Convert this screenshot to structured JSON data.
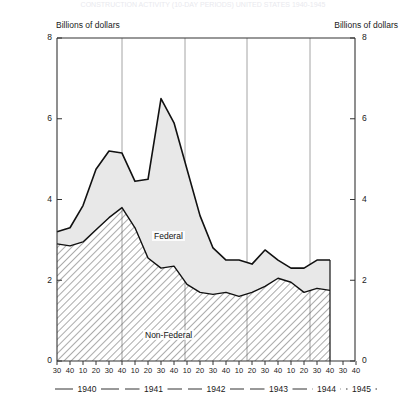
{
  "title_cut": "CONSTRUCTION ACTIVITY (10-DAY PERIODS) UNITED STATES 1940-1945",
  "axis_caption_left": "Billions of dollars",
  "axis_caption_right": "Billions of dollars",
  "series_labels": {
    "federal": "Federal",
    "non_federal": "Non-Federal"
  },
  "colors": {
    "federal_fill": "#e8e8e8",
    "non_federal_fill": "#ffffff",
    "line": "#111111",
    "grid": "#9a9a9a",
    "axis": "#333333",
    "hatch": "#444444"
  },
  "chart_data": {
    "type": "area",
    "title": "",
    "xlabel": "",
    "ylabel": "Billions of dollars",
    "ylim": [
      0,
      8
    ],
    "yticks": [
      0,
      2,
      4,
      6,
      8
    ],
    "grid": true,
    "legend_position": "inline",
    "stacked": true,
    "x_tick_labels": [
      "30",
      "40",
      "10",
      "20",
      "30",
      "40",
      "10",
      "20",
      "30",
      "40",
      "10",
      "20",
      "30",
      "40",
      "10",
      "20",
      "30",
      "40",
      "10",
      "20",
      "30",
      "40"
    ],
    "year_brackets": [
      "1940",
      "1941",
      "1942",
      "1943",
      "1944",
      "1945"
    ],
    "x": [
      0,
      1,
      2,
      3,
      4,
      5,
      6,
      7,
      8,
      9,
      10,
      11,
      12,
      13,
      14,
      15,
      16,
      17,
      18,
      19,
      20,
      21
    ],
    "series": [
      {
        "name": "Non-Federal",
        "values": [
          2.9,
          2.85,
          2.95,
          3.25,
          3.55,
          3.8,
          3.3,
          2.55,
          2.3,
          2.35,
          1.9,
          1.7,
          1.65,
          1.7,
          1.6,
          1.7,
          1.85,
          2.05,
          1.95,
          1.7,
          1.8,
          1.75
        ]
      },
      {
        "name": "Federal",
        "values": [
          0.3,
          0.45,
          0.9,
          1.5,
          1.65,
          1.35,
          1.15,
          1.95,
          4.2,
          3.55,
          2.85,
          1.9,
          1.15,
          0.8,
          0.9,
          0.7,
          0.9,
          0.45,
          0.35,
          0.6,
          0.7,
          0.75
        ]
      }
    ],
    "total": [
      3.2,
      3.3,
      3.85,
      4.75,
      5.2,
      5.15,
      4.45,
      4.5,
      6.5,
      5.9,
      4.75,
      3.6,
      2.8,
      2.5,
      2.5,
      2.4,
      2.75,
      2.5,
      2.3,
      2.3,
      2.5,
      2.5
    ],
    "notes": {
      "total_peak_value": 6.5,
      "total_peak_period": "1942 (30)",
      "non_federal_peak_value": 3.8,
      "non_federal_peak_period": "1941 (30)"
    }
  }
}
